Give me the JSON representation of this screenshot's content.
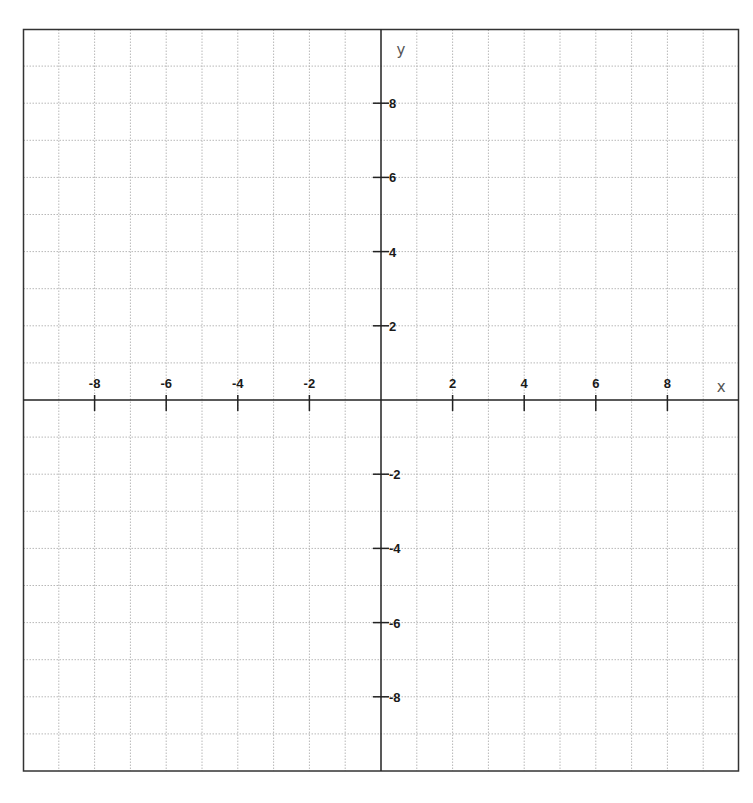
{
  "chart_data": {
    "type": "coordinate-grid",
    "title": "",
    "xlabel": "x",
    "ylabel": "y",
    "xlim": [
      -10,
      10
    ],
    "ylim": [
      -10,
      10
    ],
    "grid": true,
    "grid_step": 1,
    "x_ticks": [
      -8,
      -6,
      -4,
      -2,
      2,
      4,
      6,
      8
    ],
    "y_ticks": [
      8,
      6,
      4,
      2,
      -2,
      -4,
      -6,
      -8
    ],
    "x_tick_labels": [
      "-8",
      "-6",
      "-4",
      "-2",
      "2",
      "4",
      "6",
      "8"
    ],
    "y_tick_labels": [
      "8",
      "6",
      "4",
      "2",
      "-2",
      "-4",
      "-6",
      "-8"
    ],
    "series": []
  },
  "colors": {
    "axis": "#222222",
    "border": "#333333",
    "grid": "#b8b8b8",
    "label": "#1a1a1a",
    "axis_name": "#555555"
  }
}
